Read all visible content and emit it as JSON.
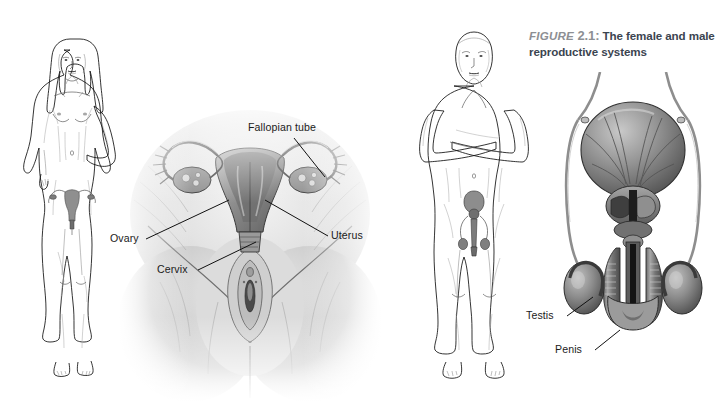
{
  "figure": {
    "caption": {
      "figure_word": "FIGURE",
      "figure_number": "2.1:",
      "text": "The female and male reproductive systems"
    },
    "panels": [
      {
        "name": "female-whole-body",
        "description": "Line drawing of a standing nude female figure, front view, with internal reproductive organs overlaid on the pelvis"
      },
      {
        "name": "female-reproductive-anatomy",
        "description": "Shaded anatomical drawing of the female pelvis showing the uterus, fallopian tubes, ovaries, cervix and vulva"
      },
      {
        "name": "male-whole-body",
        "description": "Line drawing of a standing nude male figure with arms crossed, front view, with internal reproductive organs overlaid on the pelvis"
      },
      {
        "name": "male-reproductive-anatomy",
        "description": "Shaded anatomical drawing of the male reproductive system showing the bladder, prostate, vas deferens, testes and penis"
      }
    ],
    "labels": {
      "female": [
        {
          "id": "fallopian-tube",
          "text": "Fallopian tube"
        },
        {
          "id": "ovary",
          "text": "Ovary"
        },
        {
          "id": "cervix",
          "text": "Cervix"
        },
        {
          "id": "uterus",
          "text": "Uterus"
        }
      ],
      "male": [
        {
          "id": "testis",
          "text": "Testis"
        },
        {
          "id": "penis",
          "text": "Penis"
        }
      ]
    },
    "colors": {
      "background": "#ffffff",
      "label_text": "#1b1b1b",
      "caption_figure": "#8d8f93",
      "caption_body": "#3b4450",
      "leader_line": "#111111",
      "illustration_ink": "#5e5e5e",
      "illustration_shade": "#b9b9b9"
    }
  }
}
